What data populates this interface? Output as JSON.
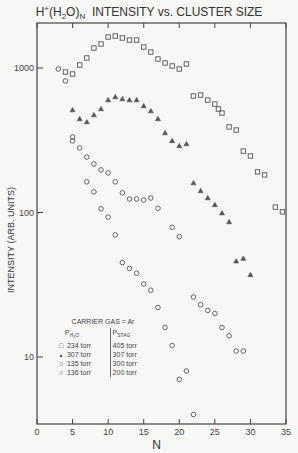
{
  "chart_data": {
    "type": "scatter",
    "title": "H+(H2O)N INTENSITY vs. CLUSTER SIZE",
    "xlabel": "N",
    "ylabel": "INTENSITY (ARB. UNITS)",
    "xlim": [
      0,
      35
    ],
    "ylim": [
      3,
      5000
    ],
    "yscale": "log",
    "x_ticks": [
      0,
      5,
      10,
      15,
      20,
      25,
      30,
      35
    ],
    "y_ticks": [
      10,
      100,
      1000
    ],
    "grid": false,
    "legend_title": "CARRIER GAS = Ar",
    "legend_columns": [
      "P_H2O",
      "P_STAG"
    ],
    "series": [
      {
        "name": "234 torr / 405 torr",
        "p_h2o": "234 torr",
        "p_stag": "405 torr",
        "marker": "square",
        "x": [
          4,
          5,
          6,
          7,
          8,
          9,
          10,
          11,
          12,
          13,
          14,
          15,
          16,
          17,
          18,
          19,
          20,
          21,
          22,
          23,
          24,
          25,
          25.5,
          26,
          27,
          28,
          29,
          30,
          31,
          32,
          33.5,
          34.5
        ],
        "y": [
          938,
          909,
          1049,
          1173,
          1375,
          1466,
          1638,
          1664,
          1613,
          1561,
          1561,
          1397,
          1290,
          1154,
          1083,
          1033,
          984,
          1066,
          640,
          650,
          600,
          563,
          520,
          488,
          391,
          372,
          266,
          246,
          191,
          182,
          109,
          101
        ]
      },
      {
        "name": "307 torr / 307 torr",
        "p_h2o": "307 torr",
        "p_stag": "307 torr",
        "marker": "triangle",
        "x": [
          5,
          6,
          7,
          8,
          9,
          10,
          11,
          12,
          13,
          14,
          15,
          16,
          17,
          18,
          19,
          20,
          21,
          22,
          23,
          24,
          25,
          26,
          27,
          28,
          29,
          30
        ],
        "y": [
          512,
          444,
          423,
          473,
          520,
          600,
          630,
          610,
          600,
          600,
          546,
          504,
          444,
          355,
          313,
          289,
          298,
          160,
          141,
          126,
          113,
          99,
          86,
          46,
          48,
          37
        ]
      },
      {
        "name": "135 torr / 300 torr",
        "p_h2o": "135 torr",
        "p_stag": "300 torr",
        "marker": "circle",
        "x": [
          3,
          5,
          5,
          6,
          7,
          8,
          9,
          10,
          11,
          12,
          13,
          14,
          15,
          16,
          17,
          19,
          20,
          22,
          23,
          24,
          25,
          26,
          27,
          28,
          29
        ],
        "y": [
          984,
          333,
          313,
          280,
          242,
          217,
          197,
          188,
          163,
          137,
          124,
          124,
          122,
          126,
          107,
          79,
          68,
          26,
          23,
          21,
          20,
          16,
          14,
          11,
          11
        ]
      },
      {
        "name": "136 torr / 200 torr",
        "p_h2o": "136 torr",
        "p_stag": "200 torr",
        "marker": "circle",
        "x": [
          4,
          7,
          8,
          9,
          10,
          11,
          12,
          13,
          14,
          15,
          16,
          17,
          18,
          19,
          20,
          21,
          22
        ],
        "y": [
          813,
          163,
          139,
          106,
          93,
          70,
          45,
          41,
          38,
          32,
          29,
          22,
          16,
          12,
          7,
          8,
          4
        ]
      }
    ]
  },
  "title": {
    "prefix": "H",
    "sup": "+",
    "mid1": "(H",
    "sub1": "2",
    "mid2": "O)",
    "sub2": "N",
    "rest": "  INTENSITY vs. CLUSTER SIZE"
  },
  "legend": {
    "carrier": "CARRIER GAS = Ar",
    "col1_head": "P",
    "col1_sub": "H₂O",
    "col2_head": "P",
    "col2_sub": "STAG",
    "rows": [
      {
        "symbol": "□",
        "p_h2o": "234 torr",
        "p_stag": "405 torr"
      },
      {
        "symbol": "▲",
        "p_h2o": "307 torr",
        "p_stag": "307 torr"
      },
      {
        "symbol": "○",
        "p_h2o": "135 torr",
        "p_stag": "300 torr"
      },
      {
        "symbol": "○",
        "p_h2o": "136 torr",
        "p_stag": "200 torr"
      }
    ]
  }
}
